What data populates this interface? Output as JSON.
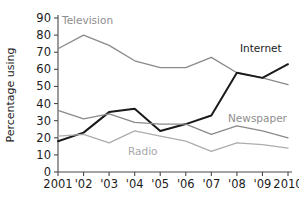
{
  "chart_data": {
    "type": "line",
    "title": "",
    "xlabel": "",
    "ylabel": "Percentage using",
    "ylim": [
      0,
      90
    ],
    "ytick_step": 10,
    "grid": false,
    "legend_position": "inline-labels",
    "x": [
      2001,
      2002,
      2003,
      2004,
      2005,
      2006,
      2007,
      2008,
      2009,
      2010
    ],
    "xtick_labels": [
      "2001",
      "'02",
      "'03",
      "'04",
      "'05",
      "'06",
      "'07",
      "'08",
      "'09",
      "2010"
    ],
    "ytick_labels": [
      "0",
      "10",
      "20",
      "30",
      "40",
      "50",
      "60",
      "70",
      "80",
      "90"
    ],
    "series": [
      {
        "name": "Television",
        "color": "#8a8a8a",
        "width": 1.3,
        "label_color": "#8e8e8e",
        "values": [
          72,
          80,
          74,
          65,
          61,
          61,
          67,
          58,
          55,
          51
        ]
      },
      {
        "name": "Internet",
        "color": "#1a1a1a",
        "width": 2.0,
        "label_color": "#1a1a1a",
        "values": [
          18,
          23,
          35,
          37,
          24,
          28,
          33,
          58,
          55,
          63
        ]
      },
      {
        "name": "Newspaper",
        "color": "#8a8a8a",
        "width": 1.3,
        "label_color": "#8e8e8e",
        "values": [
          36,
          31,
          34,
          29,
          28,
          28,
          22,
          27,
          24,
          20
        ]
      },
      {
        "name": "Radio",
        "color": "#adadad",
        "width": 1.3,
        "label_color": "#a8a8a8",
        "values": [
          21,
          22,
          17,
          24,
          21,
          18,
          12,
          17,
          16,
          14
        ]
      }
    ],
    "annotations": [
      {
        "text": "Television",
        "series": "Television",
        "x_px": 62,
        "y_px": 24
      },
      {
        "text": "Internet",
        "series": "Internet",
        "x_px": 240,
        "y_px": 52
      },
      {
        "text": "Newspaper",
        "series": "Newspaper",
        "x_px": 228,
        "y_px": 122
      },
      {
        "text": "Radio",
        "series": "Radio",
        "x_px": 128,
        "y_px": 155
      }
    ]
  },
  "axes": {
    "y_axis_title": "Percentage using"
  }
}
